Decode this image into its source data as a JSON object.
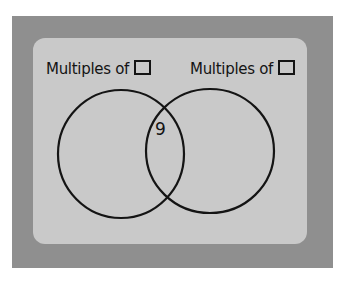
{
  "photo": {
    "subject": "Whiteboard with a two-circle Venn diagram",
    "colors": {
      "backdrop": "#8f8f8f",
      "board": "#c9c9c9",
      "ink": "#141414",
      "background": "#ffffff"
    }
  },
  "venn": {
    "left_set": {
      "label": "Multiples of",
      "blank_box": true
    },
    "right_set": {
      "label": "Multiples of",
      "blank_box": true
    },
    "regions": {
      "left_only": [],
      "intersection": [
        "9"
      ],
      "right_only": []
    }
  }
}
